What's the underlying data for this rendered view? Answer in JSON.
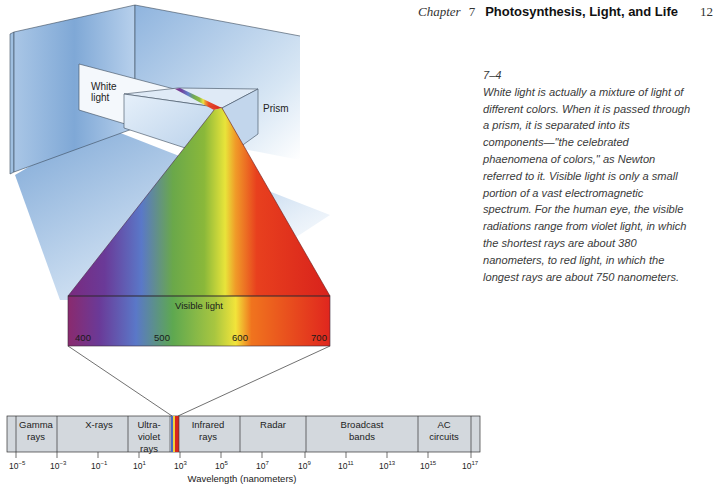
{
  "header": {
    "chapter_label": "Chapter",
    "chapter_number": "7",
    "chapter_title": "Photosynthesis, Light, and Life",
    "page_number": "12"
  },
  "caption": {
    "figure_number": "7–4",
    "text": "White light is actually a mixture of light of different colors. When it is passed through a prism, it is separated into its components—\"the celebrated phaenomena of colors,\" as Newton referred to it. Visible light is only a small portion of a vast electromagnetic spectrum. For the human eye, the visible radiations range from violet light, in which the shortest rays are about 380 nanometers, to red light, in which the longest rays are about 750 nanometers."
  },
  "illustration": {
    "white_light_label_1": "White",
    "white_light_label_2": "light",
    "prism_label": "Prism",
    "visible_light_label": "Visible light",
    "visible_ticks": [
      "400",
      "500",
      "600",
      "700"
    ]
  },
  "spectrum": {
    "bands": [
      {
        "line1": "Gamma",
        "line2": "rays",
        "line3": ""
      },
      {
        "line1": "X-rays",
        "line2": "",
        "line3": ""
      },
      {
        "line1": "Ultra-",
        "line2": "violet",
        "line3": "rays"
      },
      {
        "line1": "Infrared",
        "line2": "rays",
        "line3": ""
      },
      {
        "line1": "Radar",
        "line2": "",
        "line3": ""
      },
      {
        "line1": "Broadcast",
        "line2": "bands",
        "line3": ""
      },
      {
        "line1": "AC",
        "line2": "circuits",
        "line3": ""
      }
    ],
    "tick_labels": [
      {
        "base": "10",
        "exp": "−5"
      },
      {
        "base": "10",
        "exp": "−3"
      },
      {
        "base": "10",
        "exp": "−1"
      },
      {
        "base": "10",
        "exp": "1"
      },
      {
        "base": "10",
        "exp": "3"
      },
      {
        "base": "10",
        "exp": "5"
      },
      {
        "base": "10",
        "exp": "7"
      },
      {
        "base": "10",
        "exp": "9"
      },
      {
        "base": "10",
        "exp": "11"
      },
      {
        "base": "10",
        "exp": "13"
      },
      {
        "base": "10",
        "exp": "15"
      },
      {
        "base": "10",
        "exp": "17"
      }
    ],
    "axis_label": "Wavelength (nanometers)"
  },
  "colors": {
    "band_fill": "#d3d8dd",
    "wall_blue": "#8fb4da",
    "violet": "#7a2a7e",
    "blue": "#5a78c8",
    "green": "#6fa33a",
    "yellow": "#f2e23a",
    "orange": "#f08a1e",
    "red": "#e0261e"
  }
}
